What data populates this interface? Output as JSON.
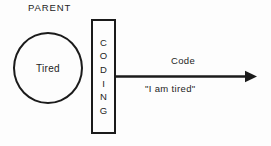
{
  "diagram": {
    "title_label": "PARENT",
    "circle": {
      "name": "tired-circle",
      "text": "Tired",
      "shape": "circle",
      "stroke_color": "#1b1b1b"
    },
    "process_box": {
      "name": "coding-box",
      "text": "CODING",
      "letters": [
        "C",
        "O",
        "D",
        "I",
        "N",
        "G"
      ],
      "orientation": "vertical-stacked",
      "stroke_color": "#1b1b1b"
    },
    "arrow": {
      "name": "code-arrow",
      "direction": "right",
      "label_above": "Code",
      "label_below": "\"I am tired\"",
      "stroke_color": "#1b1b1b"
    },
    "background_color": "#fdfdfd",
    "ink_color": "#242424"
  }
}
